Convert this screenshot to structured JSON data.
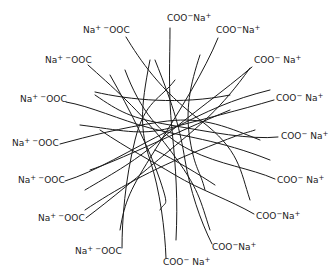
{
  "diagram": {
    "type": "sodium carboxylate chain aggregate",
    "line_color": "#1a1a1a",
    "left_labels": [
      {
        "text": "Na⁺⁻OOC",
        "x": 83,
        "y": 25
      },
      {
        "text": "Na⁺⁻OOC",
        "x": 45,
        "y": 55
      },
      {
        "text": "Na⁺⁻OOC",
        "x": 20,
        "y": 94
      },
      {
        "text": "Na⁺⁻OOC",
        "x": 12,
        "y": 138
      },
      {
        "text": "Na⁺⁻OOC",
        "x": 18,
        "y": 175
      },
      {
        "text": "Na⁺⁻OOC",
        "x": 38,
        "y": 213
      },
      {
        "text": "Na⁺⁻OOC",
        "x": 75,
        "y": 246
      }
    ],
    "right_labels": [
      {
        "text": "COO⁻Na⁺",
        "x": 167,
        "y": 13
      },
      {
        "text": "COO⁻Na⁺",
        "x": 216,
        "y": 25
      },
      {
        "text": "COO⁻ Na⁺",
        "x": 254,
        "y": 55
      },
      {
        "text": "COO⁻ Na⁺",
        "x": 276,
        "y": 93
      },
      {
        "text": "COO⁻ Na⁺",
        "x": 281,
        "y": 131
      },
      {
        "text": "COO⁻ Na⁺",
        "x": 277,
        "y": 175
      },
      {
        "text": "COO⁻Na⁺",
        "x": 256,
        "y": 211
      },
      {
        "text": "COO⁻Na⁺",
        "x": 212,
        "y": 242
      },
      {
        "text": "COO⁻ Na⁺",
        "x": 163,
        "y": 257
      }
    ]
  }
}
